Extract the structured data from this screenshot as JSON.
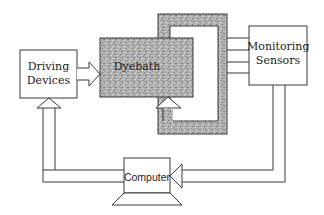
{
  "diagram": {
    "type": "block-diagram",
    "colors": {
      "line": "#3a3a3a",
      "shade_fill": "#b0b0b0",
      "shade_dark": "#8c8c8c",
      "background": "#ffffff"
    },
    "nodes": {
      "driving_devices": {
        "label_line1": "Driving",
        "label_line2": "Devices"
      },
      "dyebath": {
        "label": "Dyebath"
      },
      "monitoring_sensors": {
        "label_line1": "Monitoring",
        "label_line2": "Sensors"
      },
      "computer": {
        "label": "Computer"
      }
    },
    "edges": [
      {
        "from": "driving_devices",
        "to": "dyebath",
        "style": "hollow-arrow"
      },
      {
        "from": "dyebath",
        "to": "monitoring_sensors",
        "style": "shaded-loop-with-4-lines"
      },
      {
        "from": "monitoring_sensors",
        "to": "computer",
        "style": "hollow-arrow"
      },
      {
        "from": "computer",
        "to": "driving_devices",
        "style": "hollow-arrow"
      },
      {
        "from": "shaded-loop",
        "to": "dyebath",
        "style": "hollow-arrow-up"
      }
    ]
  }
}
